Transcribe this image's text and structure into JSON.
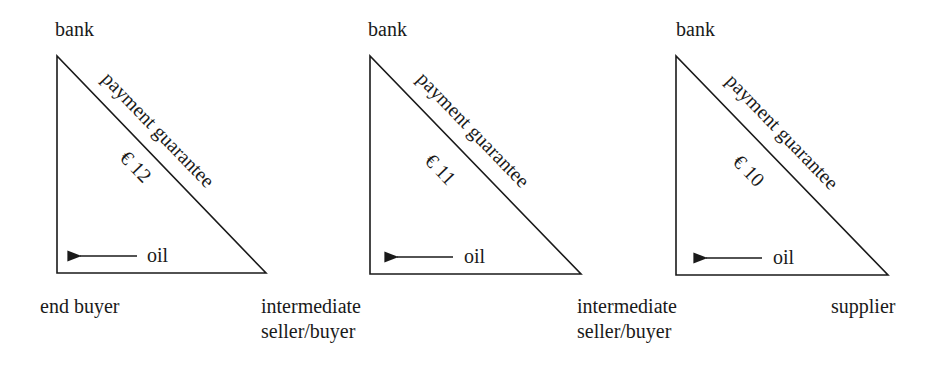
{
  "colors": {
    "line": "#1a1a1a",
    "background": "#ffffff"
  },
  "panels": [
    {
      "top_label": "bank",
      "hypotenuse_label": "payment guarantee",
      "price": "€ 12",
      "flow_label": "oil",
      "flow_direction": "left",
      "bottom_left_label": "end buyer",
      "bottom_right_label_line1": "intermediate",
      "bottom_right_label_line2": "seller/buyer"
    },
    {
      "top_label": "bank",
      "hypotenuse_label": "payment guarantee",
      "price": "€ 11",
      "flow_label": "oil",
      "flow_direction": "left",
      "bottom_left_label": "",
      "bottom_right_label_line1": "intermediate",
      "bottom_right_label_line2": "seller/buyer"
    },
    {
      "top_label": "bank",
      "hypotenuse_label": "payment guarantee",
      "price": "€ 10",
      "flow_label": "oil",
      "flow_direction": "left",
      "bottom_left_label": "",
      "bottom_right_label_line1": "supplier",
      "bottom_right_label_line2": ""
    }
  ]
}
